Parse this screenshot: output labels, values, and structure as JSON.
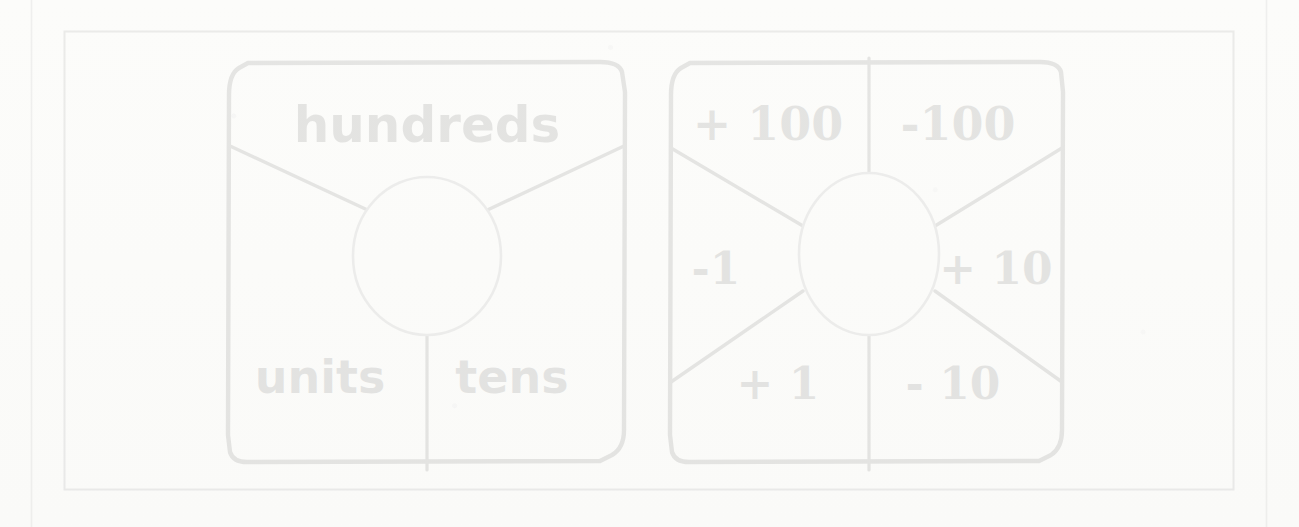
{
  "page": {
    "background_color": "#fdfdfc",
    "margin_rule_color": "#777777",
    "frame_border_color": "#555555",
    "card_stroke_color": "#111111",
    "spinner_stroke_color": "#6b6b6b",
    "divider_stroke_color": "#141414"
  },
  "cards": [
    {
      "id": "place-value-card",
      "name": "place-value-spinner",
      "sectors": [
        {
          "key": "hundreds",
          "label": "hundreds",
          "position": "top"
        },
        {
          "key": "units",
          "label": "units",
          "position": "bottom-left"
        },
        {
          "key": "tens",
          "label": "tens",
          "position": "bottom-right"
        }
      ]
    },
    {
      "id": "operation-card",
      "name": "add-subtract-spinner",
      "sectors": [
        {
          "key": "plus-100",
          "label": "+ 100",
          "position": "top-left"
        },
        {
          "key": "minus-100",
          "label": "-100",
          "position": "top-right"
        },
        {
          "key": "minus-1",
          "label": "-1",
          "position": "left"
        },
        {
          "key": "plus-10",
          "label": "+ 10",
          "position": "right"
        },
        {
          "key": "plus-1",
          "label": "+ 1",
          "position": "bottom-left"
        },
        {
          "key": "minus-10",
          "label": "- 10",
          "position": "bottom-right"
        }
      ]
    }
  ]
}
